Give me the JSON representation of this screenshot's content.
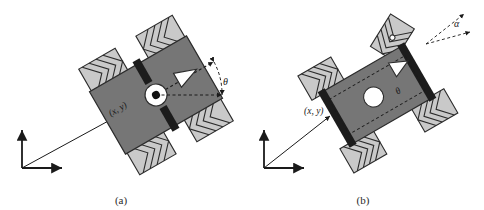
{
  "figure": {
    "background": "#ffffff",
    "width": 484,
    "height": 210
  },
  "colors": {
    "body_fill": "#767676",
    "body_stroke": "#2b2b2b",
    "wheel_fill": "#c9c9c9",
    "wheel_roller_fill": "#b4b4b4",
    "wheel_stroke": "#2b2b2b",
    "axle_fill": "#1c1c1c",
    "hub_fill": "#ffffff",
    "hub_dot": "#111111",
    "heading_triangle_fill": "#ffffff",
    "dashed_line": "#1a1a1a",
    "axis_color": "#1a1a1a",
    "text": "#1a1a1a"
  },
  "panels": [
    {
      "id": "a",
      "caption": "(a)",
      "robot_type": "omnidirectional-mecanum-four-wheel",
      "body_rotation_deg": -30,
      "wheel_count": 4,
      "position_label": "(x, y)",
      "orientation_label": "θ",
      "steering_label": null,
      "has_center_hub": true,
      "has_heading_triangle": true,
      "frame": {
        "origin_x": 22,
        "origin_y": 168,
        "x_axis_label": "",
        "y_axis_label": "",
        "position_vector": true
      }
    },
    {
      "id": "b",
      "caption": "(b)",
      "robot_type": "steered-four-wheel",
      "body_rotation_deg": -30,
      "wheel_count": 4,
      "position_label": "(x, y)",
      "orientation_label": "θ",
      "steering_label": "α",
      "has_center_hub": true,
      "has_heading_triangle": true,
      "frame": {
        "origin_x": 22,
        "origin_y": 168,
        "x_axis_label": "",
        "y_axis_label": "",
        "position_vector": true
      }
    }
  ]
}
